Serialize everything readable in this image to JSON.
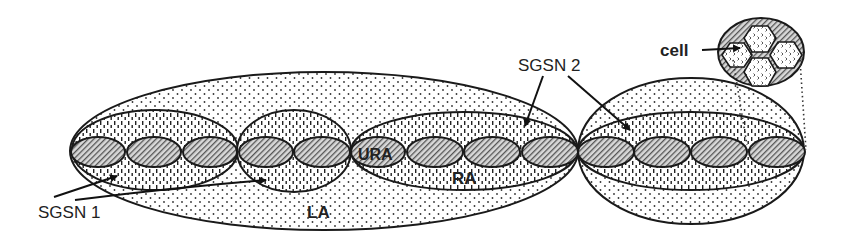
{
  "diagram": {
    "labels": {
      "sgsn1": "SGSN 1",
      "sgsn2": "SGSN 2",
      "la": "LA",
      "ra": "RA",
      "ura": "URA",
      "cell": "cell"
    },
    "areas": {
      "location_areas": 2,
      "routing_areas": 4,
      "ura_cells": 13
    },
    "colors": {
      "stroke": "#1a1a1a",
      "background": "#ffffff"
    }
  }
}
